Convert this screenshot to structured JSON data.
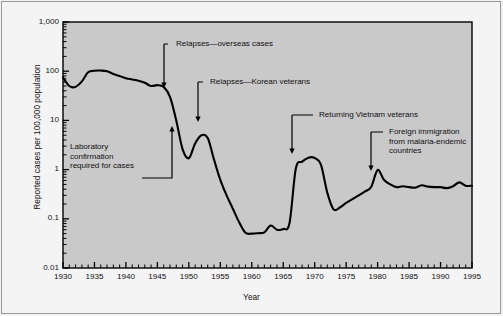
{
  "chart_data": {
    "type": "line",
    "title": "",
    "xlabel": "Year",
    "ylabel": "Reported cases per 100,000 population",
    "yscale": "log",
    "ylim": [
      0.01,
      1000
    ],
    "xlim": [
      1930,
      1995
    ],
    "y_tick_labels": [
      "1,000",
      "100",
      "10",
      "1",
      "0.1",
      "0.01"
    ],
    "y_tick_values": [
      1000,
      100,
      10,
      1,
      0.1,
      0.01
    ],
    "x_tick_labels": [
      "1930",
      "1935",
      "1940",
      "1945",
      "1950",
      "1955",
      "1960",
      "1965",
      "1970",
      "1975",
      "1980",
      "1985",
      "1990",
      "1995"
    ],
    "x_tick_values": [
      1930,
      1935,
      1940,
      1945,
      1950,
      1955,
      1960,
      1965,
      1970,
      1975,
      1980,
      1985,
      1990,
      1995
    ],
    "x_minor_tick_interval": 1,
    "grid": false,
    "legend": "none",
    "series": [
      {
        "name": "Reported malaria cases per 100,000 population",
        "x": [
          1930,
          1931,
          1932,
          1933,
          1934,
          1935,
          1936,
          1937,
          1938,
          1939,
          1940,
          1941,
          1942,
          1943,
          1944,
          1945,
          1946,
          1947,
          1948,
          1949,
          1950,
          1951,
          1952,
          1953,
          1954,
          1955,
          1956,
          1957,
          1958,
          1959,
          1960,
          1961,
          1962,
          1963,
          1964,
          1965,
          1966,
          1967,
          1968,
          1969,
          1970,
          1971,
          1972,
          1973,
          1974,
          1975,
          1976,
          1977,
          1978,
          1979,
          1980,
          1981,
          1982,
          1983,
          1984,
          1985,
          1986,
          1987,
          1988,
          1989,
          1990,
          1991,
          1992,
          1993,
          1994,
          1995
        ],
        "y": [
          75,
          50,
          48,
          62,
          95,
          102,
          103,
          100,
          88,
          80,
          72,
          68,
          64,
          58,
          50,
          52,
          48,
          30,
          10,
          2.6,
          1.7,
          3.4,
          5.0,
          4.4,
          1.6,
          0.62,
          0.3,
          0.16,
          0.085,
          0.052,
          0.05,
          0.051,
          0.053,
          0.073,
          0.06,
          0.062,
          0.082,
          1.05,
          1.45,
          1.75,
          1.72,
          1.25,
          0.34,
          0.155,
          0.17,
          0.21,
          0.25,
          0.3,
          0.36,
          0.45,
          0.98,
          0.62,
          0.5,
          0.44,
          0.46,
          0.44,
          0.43,
          0.48,
          0.45,
          0.44,
          0.44,
          0.42,
          0.46,
          0.55,
          0.47,
          0.47
        ]
      }
    ],
    "annotations": [
      {
        "id": "relapses-overseas-cases",
        "label": "Relapses—overseas cases",
        "text_x": 176,
        "text_y": 39,
        "leader": "M 164,44 L 168,44 M 164,44 L 164,81 L 164,85",
        "arrow_tip_x": 164,
        "arrow_tip_y": 88
      },
      {
        "id": "relapses-korean-veterans",
        "label": "Relapses—Korean veterans",
        "text_x": 210,
        "text_y": 77,
        "leader": "M 198,82 L 203,82 M 198,82 L 198,118",
        "arrow_tip_x": 198,
        "arrow_tip_y": 122
      },
      {
        "id": "returning-vietnam-veterans",
        "label": "Returning Vietnam veterans",
        "text_x": 319,
        "text_y": 110,
        "leader": "M 292,115 L 313,115 M 292,115 L 292,150",
        "arrow_tip_x": 292,
        "arrow_tip_y": 154
      },
      {
        "id": "foreign-immigration",
        "label": "Foreign immigration\nfrom malaria-endemic\ncountries",
        "text_x": 389,
        "text_y": 127,
        "leader": "M 371,132 L 383,132 M 371,132 L 371,167",
        "arrow_tip_x": 371,
        "arrow_tip_y": 171
      },
      {
        "id": "laboratory-confirmation",
        "label": "Laboratory\nconfirmation\nrequired for cases",
        "text_x": 70,
        "text_y": 142,
        "leader": "M 142,178 L 172,178 L 172,130",
        "arrow_tip_x": 172,
        "arrow_tip_y": 126
      }
    ]
  },
  "figure": {
    "plot_background_color": "#c9c9c9",
    "figure_background_color": "#f4f4f4",
    "line_color": "#000000",
    "axis_color": "#000000"
  }
}
